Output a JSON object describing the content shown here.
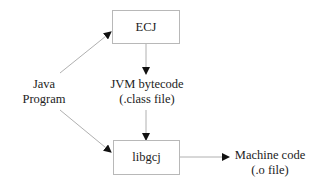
{
  "diagram": {
    "nodes": {
      "ecj": {
        "label": "ECJ",
        "shape": "box"
      },
      "libgcj": {
        "label": "libgcj",
        "shape": "box"
      },
      "java_program": {
        "line1": "Java",
        "line2": "Program",
        "shape": "text"
      },
      "bytecode": {
        "line1": "JVM bytecode",
        "line2": "(.class file)",
        "shape": "text"
      },
      "machine_code": {
        "line1": "Machine code",
        "line2": "(.o file)",
        "shape": "text"
      }
    },
    "edges": [
      {
        "from": "java_program",
        "to": "ecj"
      },
      {
        "from": "java_program",
        "to": "libgcj"
      },
      {
        "from": "ecj",
        "to": "bytecode"
      },
      {
        "from": "bytecode",
        "to": "libgcj"
      },
      {
        "from": "libgcj",
        "to": "machine_code"
      }
    ],
    "colors": {
      "line": "#b0b0b0",
      "arrowhead": "#111111",
      "box_border": "#b8b8b8",
      "text": "#222222"
    }
  }
}
